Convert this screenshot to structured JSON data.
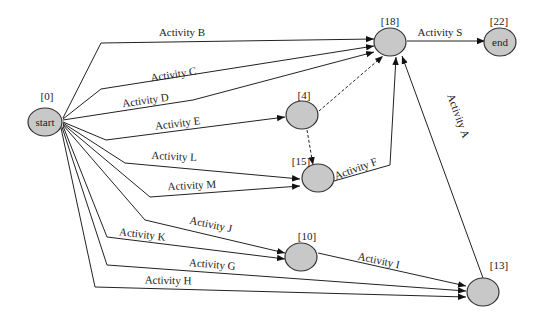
{
  "diagram": {
    "type": "activity-network",
    "nodes": [
      {
        "id": "start",
        "label": "[0]",
        "text": "start"
      },
      {
        "id": "n4",
        "label": "[4]",
        "text": ""
      },
      {
        "id": "n10",
        "label": "[10]",
        "text": ""
      },
      {
        "id": "n13",
        "label": "[13]",
        "text": ""
      },
      {
        "id": "n15",
        "label": "[15]",
        "text": ""
      },
      {
        "id": "n18",
        "label": "[18]",
        "text": ""
      },
      {
        "id": "end",
        "label": "[22]",
        "text": "end"
      }
    ],
    "edges": {
      "B": {
        "label": "Activity B",
        "from": "start",
        "to": "n18"
      },
      "C": {
        "label": "Activity C",
        "from": "start",
        "to": "n18"
      },
      "D": {
        "label": "Activity D",
        "from": "start",
        "to": "n18"
      },
      "E": {
        "label": "Activity E",
        "from": "start",
        "to": "n4"
      },
      "L": {
        "label": "Activity L",
        "from": "start",
        "to": "n15"
      },
      "M": {
        "label": "Activity M",
        "from": "start",
        "to": "n15"
      },
      "J": {
        "label": "Activity J",
        "from": "start",
        "to": "n10"
      },
      "K": {
        "label": "Activity K",
        "from": "start",
        "to": "n10"
      },
      "G": {
        "label": "Activity G",
        "from": "start",
        "to": "n13"
      },
      "H": {
        "label": "Activity H",
        "from": "start",
        "to": "n13"
      },
      "I": {
        "label": "Activity I",
        "from": "n10",
        "to": "n13"
      },
      "F": {
        "label": "Activity F",
        "from": "n15",
        "to": "n18"
      },
      "A": {
        "label": "Activity A",
        "from": "n13",
        "to": "n18"
      },
      "S": {
        "label": "Activity S",
        "from": "n18",
        "to": "end"
      }
    },
    "dummy_edges": [
      {
        "from": "n4",
        "to": "n18",
        "style": "dashed"
      },
      {
        "from": "n4",
        "to": "n15",
        "style": "dashed"
      }
    ]
  }
}
